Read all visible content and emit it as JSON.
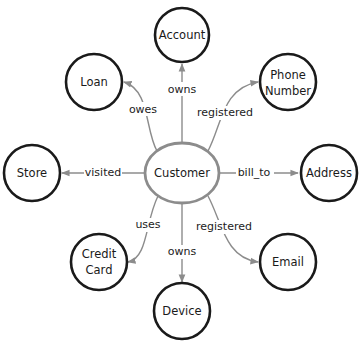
{
  "diagram": {
    "center": {
      "label": "Customer"
    },
    "nodes": [
      {
        "id": "account",
        "label_lines": [
          "Account"
        ]
      },
      {
        "id": "loan",
        "label_lines": [
          "Loan"
        ]
      },
      {
        "id": "phone",
        "label_lines": [
          "Phone",
          "Number"
        ]
      },
      {
        "id": "store",
        "label_lines": [
          "Store"
        ]
      },
      {
        "id": "address",
        "label_lines": [
          "Address"
        ]
      },
      {
        "id": "creditcard",
        "label_lines": [
          "Credit",
          "Card"
        ]
      },
      {
        "id": "email",
        "label_lines": [
          "Email"
        ]
      },
      {
        "id": "device",
        "label_lines": [
          "Device"
        ]
      }
    ],
    "edges": [
      {
        "from": "Customer",
        "to": "Account",
        "label": "owns"
      },
      {
        "from": "Customer",
        "to": "Loan",
        "label": "owes"
      },
      {
        "from": "Customer",
        "to": "Phone Number",
        "label": "registered"
      },
      {
        "from": "Customer",
        "to": "Store",
        "label": "visited"
      },
      {
        "from": "Customer",
        "to": "Address",
        "label": "bill_to"
      },
      {
        "from": "Customer",
        "to": "Credit Card",
        "label": "uses"
      },
      {
        "from": "Customer",
        "to": "Email",
        "label": "registered"
      },
      {
        "from": "Customer",
        "to": "Device",
        "label": "owns"
      }
    ]
  },
  "colors": {
    "node_stroke": "#1a1a1a",
    "center_stroke": "#8c8c8c",
    "edge": "#8c8c8c"
  }
}
